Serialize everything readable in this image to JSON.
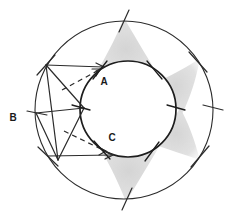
{
  "figure": {
    "background_color": "#ffffff",
    "stroke_color": "#2b2b2b",
    "shade_color": "#d8d8d8",
    "labels": [
      {
        "id": "label-A",
        "text": "A",
        "x": 106,
        "y": 81
      },
      {
        "id": "label-B",
        "text": "B",
        "x": 13,
        "y": 117
      },
      {
        "id": "label-C",
        "text": "C",
        "x": 113,
        "y": 137
      }
    ],
    "circles": [
      {
        "id": "outer-circle",
        "cx": 124,
        "cy": 110,
        "r": 89,
        "stroke": "#2b2b2b",
        "stroke_width": 1.1
      },
      {
        "id": "inner-circle",
        "cx": 128,
        "cy": 109,
        "r": 48,
        "stroke": "#1f1f1f",
        "stroke_width": 1.6
      }
    ],
    "shaded_regions": [
      {
        "id": "shade-top",
        "color": "#dcdcdc"
      },
      {
        "id": "shade-right-upper",
        "color": "#dcdcdc"
      },
      {
        "id": "shade-right-lower",
        "color": "#dcdcdc"
      },
      {
        "id": "shade-bottom",
        "color": "#dcdcdc"
      }
    ],
    "solid_segments": [
      {
        "id": "seg-top-to-A",
        "x1": 46,
        "y1": 65,
        "x2": 103,
        "y2": 67
      },
      {
        "id": "seg-bottom-to-C",
        "x1": 48,
        "y1": 156,
        "x2": 112,
        "y2": 155
      },
      {
        "id": "seg-B-to-inner-right",
        "x1": 36,
        "y1": 113,
        "x2": 84,
        "y2": 108
      },
      {
        "id": "seg-B-to-bottom-left",
        "x1": 36,
        "y1": 113,
        "x2": 58,
        "y2": 160
      },
      {
        "id": "seg-topleft-to-inner",
        "x1": 46,
        "y1": 65,
        "x2": 84,
        "y2": 108
      },
      {
        "id": "seg-topleft-down",
        "x1": 46,
        "y1": 65,
        "x2": 58,
        "y2": 160
      },
      {
        "id": "seg-inner-to-bottomleft",
        "x1": 84,
        "y1": 108,
        "x2": 58,
        "y2": 160
      }
    ],
    "dashed_segments": [
      {
        "id": "dash-upper",
        "x1": 62,
        "y1": 90,
        "x2": 101,
        "y2": 69
      },
      {
        "id": "dash-lower",
        "x1": 64,
        "y1": 131,
        "x2": 107,
        "y2": 152
      }
    ],
    "arrow_heads": [
      {
        "id": "arrowhead-A",
        "x": 104,
        "y": 67,
        "angle": 2
      },
      {
        "id": "arrowhead-C",
        "x": 113,
        "y": 155,
        "angle": -2
      },
      {
        "id": "arrowhead-dash-upper",
        "x": 101,
        "y": 69,
        "angle": -28
      },
      {
        "id": "arrowhead-dash-lower",
        "x": 107,
        "y": 152,
        "angle": 26
      }
    ],
    "tick_marks": [
      {
        "id": "tick-outer-top",
        "x": 124,
        "y": 21,
        "angle": 25
      },
      {
        "id": "tick-outer-upper-left",
        "x": 46,
        "y": 65,
        "angle": -38
      },
      {
        "id": "tick-outer-left",
        "x": 36,
        "y": 113,
        "angle": 82
      },
      {
        "id": "tick-outer-lower-left",
        "x": 48,
        "y": 156,
        "angle": 40
      },
      {
        "id": "tick-outer-bottom",
        "x": 127,
        "y": 199,
        "angle": 22
      },
      {
        "id": "tick-outer-lower-right",
        "x": 200,
        "y": 156,
        "angle": -40
      },
      {
        "id": "tick-outer-right",
        "x": 213,
        "y": 108,
        "angle": 86
      },
      {
        "id": "tick-outer-upper-right",
        "x": 198,
        "y": 62,
        "angle": 38
      },
      {
        "id": "tick-inner-upper-left",
        "x": 100,
        "y": 70,
        "angle": -42
      },
      {
        "id": "tick-inner-left",
        "x": 81,
        "y": 107,
        "angle": 80
      },
      {
        "id": "tick-inner-lower-left",
        "x": 102,
        "y": 150,
        "angle": 42
      },
      {
        "id": "tick-inner-bottom",
        "x": 152,
        "y": 151,
        "angle": -44
      },
      {
        "id": "tick-inner-right",
        "x": 176,
        "y": 107,
        "angle": 86
      },
      {
        "id": "tick-inner-upper-right",
        "x": 155,
        "y": 70,
        "angle": 40
      }
    ]
  }
}
